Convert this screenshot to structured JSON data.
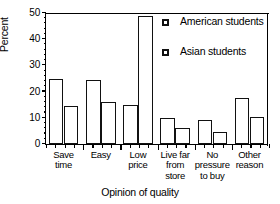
{
  "chart_data": {
    "type": "bar",
    "title": "",
    "xlabel": "Opinion of quality",
    "ylabel": "Percent",
    "ylim": [
      0,
      50
    ],
    "yticks": [
      0,
      10,
      20,
      30,
      40,
      50
    ],
    "ytick_labels": [
      "0",
      "10",
      "20",
      "30",
      "40",
      "50"
    ],
    "grid": false,
    "legend_position": "top-right",
    "categories": [
      "Save time",
      "Easy",
      "Low price",
      "Live far from store",
      "No pressure to buy",
      "Other reason"
    ],
    "category_lines": [
      [
        "Save",
        "time"
      ],
      [
        "Easy"
      ],
      [
        "Low",
        "price"
      ],
      [
        "Live far",
        "from",
        "store"
      ],
      [
        "No",
        "pressure",
        "to buy"
      ],
      [
        "Other",
        "reason"
      ]
    ],
    "series": [
      {
        "name": "American students",
        "marker": "open-square",
        "color": "#ffffff",
        "edge_color": "#111111",
        "values": [
          25,
          24.5,
          15,
          10,
          9,
          17.5
        ]
      },
      {
        "name": "Asian students",
        "marker": "open-square",
        "color": "#ffffff",
        "edge_color": "#111111",
        "values": [
          14.5,
          16,
          49,
          6,
          4.5,
          10.5
        ]
      }
    ]
  },
  "legend": {
    "items": [
      {
        "label": "American students"
      },
      {
        "label": "Asian students"
      }
    ]
  },
  "axes": {
    "y_title": "Percent",
    "x_title": "Opinion of quality"
  }
}
